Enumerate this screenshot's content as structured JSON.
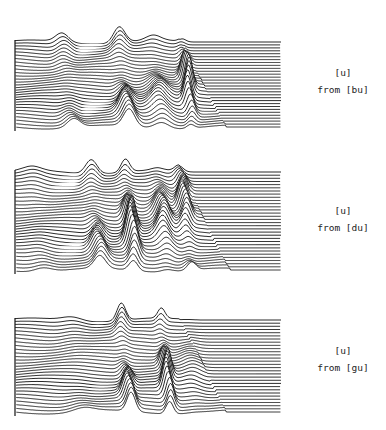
{
  "figure": {
    "panels": [
      {
        "id": "bu",
        "label_line1": "[u]",
        "label_line2": "from [bu]",
        "top": 10,
        "height": 125,
        "n_traces": 30,
        "peaks": [
          {
            "x": 62,
            "h": 9,
            "w": 9
          },
          {
            "x": 118,
            "h": 20,
            "w": 8
          },
          {
            "x": 152,
            "h": 14,
            "w": 10
          },
          {
            "x": 182,
            "h": 30,
            "w": 5
          }
        ]
      },
      {
        "id": "du",
        "label_line1": "[u]",
        "label_line2": "from [du]",
        "top": 140,
        "height": 138,
        "n_traces": 32,
        "peaks": [
          {
            "x": 32,
            "h": 4,
            "w": 12
          },
          {
            "x": 90,
            "h": 18,
            "w": 8
          },
          {
            "x": 124,
            "h": 36,
            "w": 6
          },
          {
            "x": 157,
            "h": 22,
            "w": 8
          },
          {
            "x": 180,
            "h": 24,
            "w": 6
          }
        ]
      },
      {
        "id": "gu",
        "label_line1": "[u]",
        "label_line2": "from [gu]",
        "top": 288,
        "height": 132,
        "n_traces": 30,
        "peaks": [
          {
            "x": 72,
            "h": 4,
            "w": 14
          },
          {
            "x": 120,
            "h": 22,
            "w": 6
          },
          {
            "x": 160,
            "h": 28,
            "w": 5
          },
          {
            "x": 186,
            "h": 5,
            "w": 10
          }
        ]
      }
    ]
  }
}
